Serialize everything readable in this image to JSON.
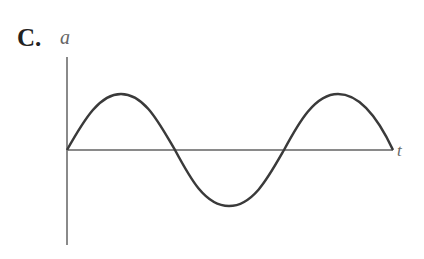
{
  "figure": {
    "option_label": "C.",
    "y_axis_label": "a",
    "x_axis_label": "t",
    "curve": "sine wave starting at origin: rises to a peak, crosses zero, falls to a trough, crosses zero, rises to a peak, returns to axis"
  },
  "colors": {
    "axis": "#8a8a8a",
    "curve": "#3a3a3a"
  }
}
